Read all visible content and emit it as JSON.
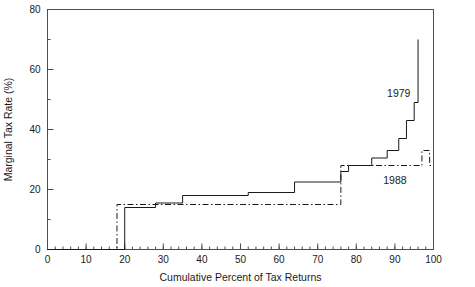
{
  "chart_data": {
    "type": "line",
    "title": "",
    "xlabel": "Cumulative Percent of Tax Returns",
    "ylabel": "Marginal Tax Rate (%)",
    "xlim": [
      0,
      100
    ],
    "ylim": [
      0,
      80
    ],
    "xticks": [
      0,
      10,
      20,
      30,
      40,
      50,
      60,
      70,
      80,
      90,
      100
    ],
    "xtick_labels": [
      "0",
      "10",
      "20",
      "30",
      "40",
      "50",
      "60",
      "70",
      "80",
      "90",
      "100"
    ],
    "yticks": [
      0,
      20,
      40,
      60,
      80
    ],
    "ytick_labels": [
      "0",
      "20",
      "40",
      "60",
      "80"
    ],
    "xminor_step": 2,
    "grid": false,
    "legend_position": "inline-annotation",
    "series": [
      {
        "name": "1979",
        "style": "solid",
        "label_x": 91,
        "label_y": 51,
        "points": [
          [
            0,
            0
          ],
          [
            20,
            0
          ],
          [
            20,
            14
          ],
          [
            28,
            14
          ],
          [
            28,
            15.5
          ],
          [
            35,
            15.5
          ],
          [
            35,
            18
          ],
          [
            52,
            18
          ],
          [
            52,
            19
          ],
          [
            64,
            19
          ],
          [
            64,
            22.5
          ],
          [
            76,
            22.5
          ],
          [
            76,
            26
          ],
          [
            78,
            26
          ],
          [
            78,
            28
          ],
          [
            84,
            28
          ],
          [
            84,
            30.5
          ],
          [
            88,
            30.5
          ],
          [
            88,
            33
          ],
          [
            91,
            33
          ],
          [
            91,
            37
          ],
          [
            93,
            37
          ],
          [
            93,
            43
          ],
          [
            95,
            43
          ],
          [
            95,
            49
          ],
          [
            96,
            49
          ],
          [
            96,
            70
          ]
        ]
      },
      {
        "name": "1988",
        "style": "dash-dot",
        "label_x": 90,
        "label_y": 22,
        "points": [
          [
            0,
            0
          ],
          [
            18,
            0
          ],
          [
            18,
            15
          ],
          [
            76,
            15
          ],
          [
            76,
            28
          ],
          [
            97,
            28
          ],
          [
            97,
            33
          ],
          [
            99,
            33
          ],
          [
            99,
            28
          ],
          [
            100,
            28
          ]
        ]
      }
    ]
  }
}
